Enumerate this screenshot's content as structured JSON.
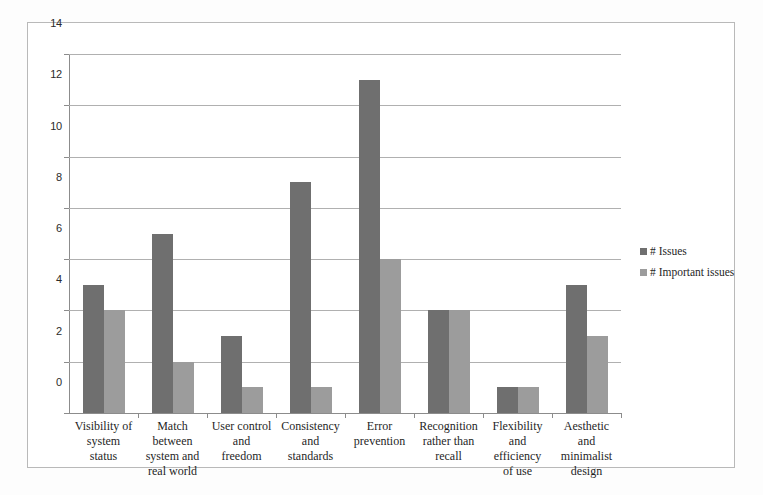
{
  "chart_data": {
    "type": "bar",
    "title": "",
    "xlabel": "",
    "ylabel": "",
    "ylim": [
      0,
      14
    ],
    "ytick_step": 2,
    "yticks": [
      0,
      2,
      4,
      6,
      8,
      10,
      12,
      14
    ],
    "grid": true,
    "legend_position": "right",
    "categories": [
      "Visibility of system status",
      "Match between system and real world",
      "User control and freedom",
      "Consistency and standards",
      "Error prevention",
      "Recognition rather than recall",
      "Flexibility and efficiency of use",
      "Aesthetic and minimalist design"
    ],
    "category_lines": [
      [
        "Visibility of",
        "system",
        "status"
      ],
      [
        "Match",
        "between",
        "system and",
        "real world"
      ],
      [
        "User control",
        "and",
        "freedom"
      ],
      [
        "Consistency",
        "and",
        "standards"
      ],
      [
        "Error",
        "prevention"
      ],
      [
        "Recognition",
        "rather than",
        "recall"
      ],
      [
        "Flexibility",
        "and",
        "efficiency",
        "of use"
      ],
      [
        "Aesthetic",
        "and",
        "minimalist",
        "design"
      ]
    ],
    "series": [
      {
        "name": "# Issues",
        "color": "#6f6f6f",
        "values": [
          5,
          7,
          3,
          9,
          13,
          4,
          1,
          5
        ]
      },
      {
        "name": "# Important issues",
        "color": "#9c9c9c",
        "values": [
          4,
          2,
          1,
          1,
          6,
          4,
          1,
          3
        ]
      }
    ]
  },
  "legend": {
    "items": [
      {
        "label": "# Issues",
        "color": "#6f6f6f"
      },
      {
        "label": "# Important issues",
        "color": "#9c9c9c"
      }
    ]
  }
}
